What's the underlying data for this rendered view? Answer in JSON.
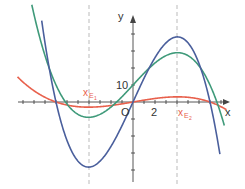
{
  "chart_data": {
    "type": "line",
    "title": "",
    "xlabel": "x",
    "ylabel": "y",
    "axis_labels": {
      "x": "x",
      "y": "y",
      "origin": "O"
    },
    "tick_labels": {
      "x": [
        "2"
      ],
      "y": [
        "10"
      ]
    },
    "x_tick_step": 1,
    "y_tick_step": 10,
    "xlim": [
      -12,
      10
    ],
    "ylim": [
      -42,
      58
    ],
    "grid": false,
    "annotations": [
      {
        "text": "xE1",
        "x": -4.04,
        "style": "dashed vertical line"
      },
      {
        "text": "xE2",
        "x": 4.04,
        "style": "dashed vertical line"
      }
    ],
    "series": [
      {
        "name": "blue cubic",
        "color": "#4a5f9c",
        "formula": "0.29*(49x - x^3)",
        "roots": [
          -7,
          0,
          7
        ],
        "max": [
          4.04,
          38
        ],
        "min": [
          -4.04,
          -38
        ]
      },
      {
        "name": "green cubic",
        "color": "#3f9a7a",
        "formula": "0.144*(49x - x^3) + 10",
        "max": [
          4.04,
          29
        ],
        "min": [
          -4.04,
          -9
        ],
        "y_intercept": 10
      },
      {
        "name": "red cubic",
        "color": "#e8604c",
        "formula": "0.023*(49x - x^3)",
        "roots": [
          -7,
          0,
          7
        ],
        "max": [
          4.04,
          3
        ],
        "min": [
          -4.04,
          -3
        ]
      }
    ]
  },
  "labels": {
    "x": "x",
    "y": "y",
    "origin": "O",
    "tick_x": "2",
    "tick_y": "10",
    "xe1_main": "x",
    "xe1_sub": "E",
    "xe1_subsub": "1",
    "xe2_main": "x",
    "xe2_sub": "E",
    "xe2_subsub": "2"
  }
}
